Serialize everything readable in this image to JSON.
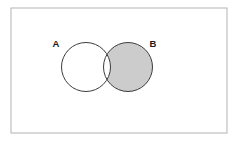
{
  "figure": {
    "name": "venn-diagram",
    "type": "venn-two-set",
    "caption_text": "",
    "width": 235,
    "height": 141,
    "background_color": "#ffffff"
  },
  "universe": {
    "name": "universal-set-rectangle",
    "label": "",
    "x": 11,
    "y": 8,
    "width": 216,
    "height": 125,
    "stroke_color": "#b3b3b3",
    "stroke_width": 1,
    "fill_color": "#ffffff"
  },
  "sets": [
    {
      "id": "A",
      "label": "A",
      "cx": 86,
      "cy": 67,
      "r": 24.5,
      "label_x": 56,
      "label_y": 44,
      "stroke_color": "#3d3d3d",
      "stroke_width": 1,
      "fill_color": "#ffffff",
      "shaded": false
    },
    {
      "id": "B",
      "label": "B",
      "cx": 128,
      "cy": 67,
      "r": 24.5,
      "label_x": 153,
      "label_y": 44,
      "stroke_color": "#3d3d3d",
      "stroke_width": 1,
      "fill_color": "#cccccc",
      "shaded": true
    }
  ],
  "shading": {
    "region_description": "B minus A",
    "shaded_region_id": "B-not-A",
    "fill_color": "#cccccc",
    "intersection_fill_color": "#ffffff",
    "a_only_fill_color": "#ffffff",
    "outside_fill_color": "#ffffff"
  },
  "colors": {
    "shade_gray": "#cccccc",
    "outline_dark": "#3d3d3d",
    "frame_gray": "#b3b3b3",
    "white": "#ffffff",
    "text_dark": "#1a1a1a"
  }
}
